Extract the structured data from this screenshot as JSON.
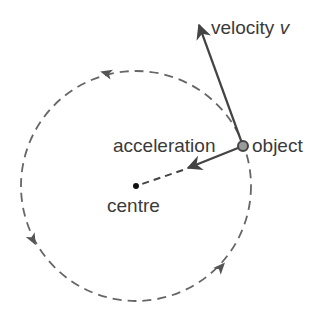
{
  "diagram": {
    "type": "circular-motion",
    "labels": {
      "velocity": "velocity",
      "velocity_symbol": "v",
      "acceleration": "acceleration",
      "object": "object",
      "centre": "centre"
    },
    "colors": {
      "line": "#555555",
      "text": "#3a3a3a",
      "object_fill": "#9a9a9a",
      "object_stroke": "#444444",
      "centre_dot": "#111111"
    },
    "geometry": {
      "centre": [
        136,
        186
      ],
      "radius": 115,
      "object": [
        243,
        146
      ],
      "velocity_tip": [
        198,
        22
      ],
      "acceleration_tip": [
        187,
        169
      ]
    },
    "direction_arrows": [
      {
        "position": [
          106,
          73
        ],
        "direction": "anticlockwise"
      },
      {
        "position": [
          33,
          240
        ],
        "direction": "anticlockwise"
      },
      {
        "position": [
          221,
          267
        ],
        "direction": "anticlockwise"
      }
    ]
  }
}
